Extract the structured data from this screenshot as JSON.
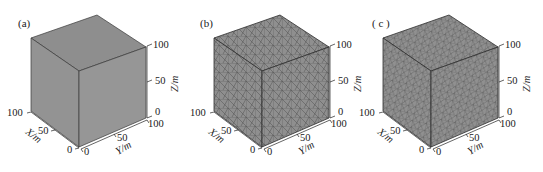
{
  "figure": {
    "panels": [
      {
        "id": "a",
        "label": "(a)",
        "mesh": "none",
        "x_axis": {
          "title": "X/m",
          "ticks": [
            "100",
            "50",
            "0"
          ]
        },
        "y_axis": {
          "title": "Y/m",
          "ticks": [
            "0",
            "50",
            "100"
          ]
        },
        "z_axis": {
          "title": "Z/m",
          "ticks": [
            "100",
            "50",
            "0"
          ]
        }
      },
      {
        "id": "b",
        "label": "(b)",
        "mesh": "coarse-tetrahedral",
        "x_axis": {
          "title": "X/m",
          "ticks": [
            "100",
            "50",
            "0"
          ]
        },
        "y_axis": {
          "title": "Y/m",
          "ticks": [
            "0",
            "50",
            "100"
          ]
        },
        "z_axis": {
          "title": "Z/m",
          "ticks": [
            "100",
            "50",
            "0"
          ]
        }
      },
      {
        "id": "c",
        "label": "( c )",
        "mesh": "fine-tetrahedral",
        "x_axis": {
          "title": "X/m",
          "ticks": [
            "100",
            "50",
            "0"
          ]
        },
        "y_axis": {
          "title": "Y/m",
          "ticks": [
            "0",
            "50",
            "100"
          ]
        },
        "z_axis": {
          "title": "Z/m",
          "ticks": [
            "100",
            "50",
            "0"
          ]
        }
      }
    ],
    "colors": {
      "face_top": "#8e8e8e",
      "face_left": "#939393",
      "face_right": "#969696",
      "edge": "#3a3a3a",
      "mesh_line": "#555555"
    }
  }
}
